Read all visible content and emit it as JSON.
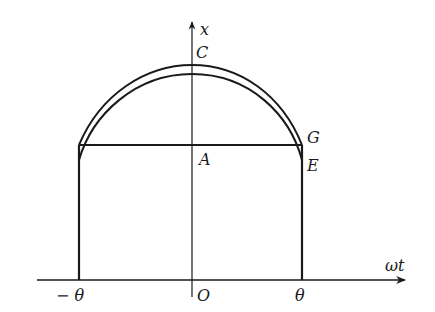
{
  "diagram": {
    "axes": {
      "y_label": "x",
      "x_label": "ωt",
      "origin_label": "O"
    },
    "points": {
      "C": "C",
      "A": "A",
      "G": "G",
      "E": "E"
    },
    "ticks": {
      "left": "− θ",
      "right": "θ"
    },
    "colors": {
      "stroke": "#1a1a1a",
      "background": "#ffffff"
    }
  }
}
